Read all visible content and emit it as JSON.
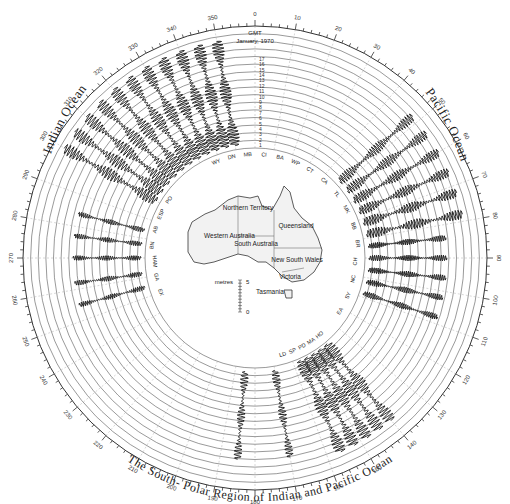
{
  "header": {
    "time_label": "GMT",
    "date_label": "January, 1970"
  },
  "regions": {
    "left": "Indian Ocean",
    "right": "Pacific Ocean",
    "bottom": "The South- Polar Region of Indian and Pacific Ocean"
  },
  "degree_labels": [
    "0",
    "10",
    "20",
    "30",
    "40",
    "50",
    "60",
    "70",
    "80",
    "90",
    "100",
    "110",
    "120",
    "130",
    "140",
    "150",
    "160",
    "170",
    "180",
    "190",
    "200",
    "210",
    "220",
    "230",
    "240",
    "250",
    "260",
    "270",
    "280",
    "290",
    "300",
    "310",
    "320",
    "330",
    "340",
    "350"
  ],
  "day_labels": [
    "1",
    "2",
    "3",
    "4",
    "5",
    "6",
    "7",
    "8",
    "9",
    "10",
    "11",
    "12",
    "13",
    "14",
    "15",
    "16",
    "17"
  ],
  "map": {
    "states": [
      "Western Australia",
      "Northern Territory",
      "Queensland",
      "South Australia",
      "New South Wales",
      "Victoria",
      "Tasmania"
    ],
    "scale_label": "metres",
    "scale_max": "5",
    "scale_min": "0"
  },
  "stations": {
    "top": [
      "WY",
      "DN",
      "MB",
      "CI",
      "BA",
      "WP"
    ],
    "right": [
      "CT",
      "CA",
      "TL",
      "MK",
      "BB",
      "BR",
      "CH",
      "NC",
      "SY",
      "EA"
    ],
    "left": [
      "EX",
      "GA",
      "HAM",
      "BN",
      "AB",
      "ESP",
      "PO"
    ],
    "bottom": [
      "HO",
      "MA",
      "PD",
      "SP",
      "LD"
    ]
  },
  "colors": {
    "ink": "#111111",
    "grid": "#555555",
    "background": "#ffffff"
  }
}
